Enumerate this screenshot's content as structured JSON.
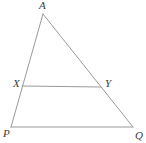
{
  "figure": {
    "kind": "geometry-diagram",
    "canvas": {
      "width": 146,
      "height": 143,
      "background": "#ffffff"
    },
    "style": {
      "stroke_color": "#9a9a9a",
      "stroke_width": 1,
      "label_color": "#3c3c3c",
      "label_font_size": "11px",
      "label_font_style": "italic"
    },
    "vertices": [
      {
        "id": "A",
        "label": "A",
        "x": 43,
        "y": 14
      },
      {
        "id": "X",
        "label": "X",
        "x": 22,
        "y": 86
      },
      {
        "id": "Y",
        "label": "Y",
        "x": 101,
        "y": 87
      },
      {
        "id": "P",
        "label": "P",
        "x": 11,
        "y": 127
      },
      {
        "id": "Q",
        "label": "Q",
        "x": 133,
        "y": 127
      }
    ],
    "segments": [
      {
        "id": "AP",
        "from": "A",
        "to": "P",
        "x1": 43,
        "y1": 14,
        "x2": 11,
        "y2": 127
      },
      {
        "id": "AQ",
        "from": "A",
        "to": "Q",
        "x1": 43,
        "y1": 14,
        "x2": 133,
        "y2": 127
      },
      {
        "id": "XY",
        "from": "X",
        "to": "Y",
        "x1": 22,
        "y1": 86,
        "x2": 101,
        "y2": 87
      },
      {
        "id": "PQ",
        "from": "P",
        "to": "Q",
        "x1": 11,
        "y1": 127,
        "x2": 133,
        "y2": 127
      }
    ]
  }
}
